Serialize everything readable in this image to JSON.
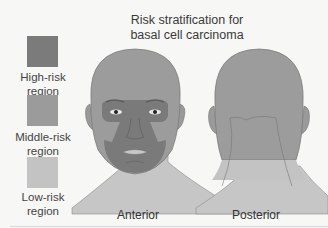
{
  "title": "Risk stratification for basal cell carcinoma",
  "title_lines": [
    "Risk stratification for",
    "basal cell carcinoma"
  ],
  "legend": [
    {
      "label_lines": [
        "High-risk",
        "region"
      ],
      "label": "High-risk region",
      "color": "#7a7a7a"
    },
    {
      "label_lines": [
        "Middle-risk",
        "region"
      ],
      "label": "Middle-risk region",
      "color": "#9a9a9a"
    },
    {
      "label_lines": [
        "Low-risk",
        "region"
      ],
      "label": "Low-risk region",
      "color": "#c2c2c2"
    }
  ],
  "views": {
    "anterior": {
      "label": "Anterior"
    },
    "posterior": {
      "label": "Posterior"
    }
  },
  "colors": {
    "high": "#7a7a7a",
    "middle": "#9a9a9a",
    "low": "#c4c4c4",
    "background": "#f7f7f5"
  }
}
